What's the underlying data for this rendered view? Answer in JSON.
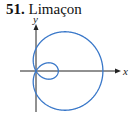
{
  "title": {
    "number": "51.",
    "label": "Limaçon"
  },
  "axes": {
    "x_label": "x",
    "y_label": "y"
  },
  "curve": {
    "name": "limaçon with inner loop",
    "equation_form": "r = a + b cos θ",
    "a": 1,
    "b": 2,
    "color": "#3a78c9"
  },
  "colors": {
    "axis": "#222222",
    "curve": "#3a78c9"
  }
}
